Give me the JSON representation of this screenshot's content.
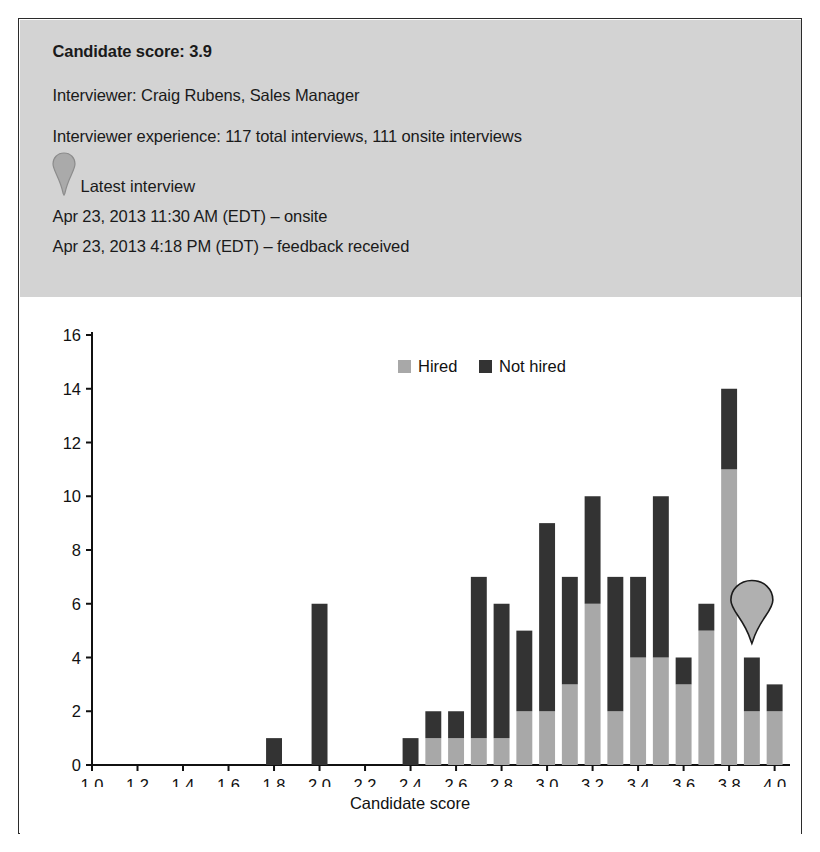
{
  "panel": {
    "candidate_score_label": "Candidate score: 3.9",
    "interviewer": "Interviewer: Craig Rubens, Sales Manager",
    "interviewer_experience": "Interviewer experience: 117 total interviews, 111 onsite interviews",
    "pin_icon_name": "map-pin-icon",
    "latest_interview_label": "Latest interview",
    "latest_interview_lines": [
      "Apr 23, 2013 11:30 AM (EDT) – onsite",
      "Apr 23, 2013 4:18 PM (EDT) – feedback received"
    ],
    "background_color": "#d3d3d3"
  },
  "chart_data": {
    "type": "bar",
    "stacked": true,
    "title": "",
    "xlabel": "Candidate score",
    "ylabel": "Number of interviews",
    "xlim": [
      1.0,
      4.05
    ],
    "ylim": [
      0,
      16
    ],
    "ytick_step": 2,
    "yticks": [
      0,
      2,
      4,
      6,
      8,
      10,
      12,
      14,
      16
    ],
    "xticks": [
      1.0,
      1.2,
      1.4,
      1.6,
      1.8,
      2.0,
      2.2,
      2.4,
      2.6,
      2.8,
      3.0,
      3.2,
      3.4,
      3.6,
      3.8,
      4.0
    ],
    "xtick_labels": [
      "1.0",
      "1.2",
      "1.4",
      "1.6",
      "1.8",
      "2.0",
      "2.2",
      "2.4",
      "2.6",
      "2.8",
      "3.0",
      "3.2",
      "3.4",
      "3.6",
      "3.8",
      "4.0"
    ],
    "grid": false,
    "bar_width": 0.07,
    "legend": {
      "position": "top-center",
      "entries": [
        {
          "name": "Hired",
          "color": "#a8a8a8"
        },
        {
          "name": "Not hired",
          "color": "#333333"
        }
      ]
    },
    "categories": [
      1.8,
      2.0,
      2.4,
      2.5,
      2.6,
      2.7,
      2.8,
      2.9,
      3.0,
      3.1,
      3.2,
      3.3,
      3.4,
      3.5,
      3.6,
      3.7,
      3.8,
      3.9,
      4.0
    ],
    "series": [
      {
        "name": "Hired",
        "color": "#a8a8a8",
        "values": [
          0,
          0,
          0,
          1,
          1,
          1,
          1,
          2,
          2,
          3,
          6,
          2,
          4,
          4,
          3,
          5,
          11,
          2,
          2
        ]
      },
      {
        "name": "Not hired",
        "color": "#333333",
        "values": [
          1,
          6,
          1,
          1,
          1,
          6,
          5,
          3,
          7,
          4,
          4,
          5,
          3,
          6,
          1,
          1,
          3,
          2,
          1
        ]
      }
    ],
    "totals": [
      1,
      6,
      1,
      2,
      2,
      7,
      6,
      5,
      9,
      7,
      10,
      7,
      7,
      10,
      4,
      6,
      14,
      4,
      3
    ],
    "annotation": {
      "name": "latest-interview-marker",
      "icon": "map-pin-icon",
      "x": 3.9,
      "y": 5.6
    }
  }
}
